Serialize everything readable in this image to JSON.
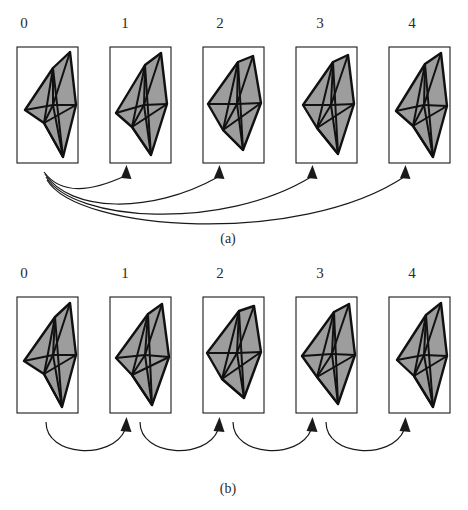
{
  "figure": {
    "width": 468,
    "height": 510,
    "background": "#ffffff",
    "ink_color": "#1a1a1a",
    "mesh_fill": "#9d9d9d",
    "mesh_edge": "#111111"
  },
  "panels": [
    {
      "id": "a",
      "caption": "(a)",
      "caption_x": 228,
      "caption_y": 243,
      "arrow_style": "fan-out-from-zero",
      "arrows": [
        {
          "from": "0",
          "to": "1"
        },
        {
          "from": "0",
          "to": "2"
        },
        {
          "from": "0",
          "to": "3"
        },
        {
          "from": "0",
          "to": "4"
        }
      ],
      "items": [
        {
          "label": "0",
          "label_x": 24,
          "label_y": 28,
          "box_x": 17,
          "box_y": 47,
          "box_w": 61,
          "box_h": 116
        },
        {
          "label": "1",
          "label_x": 125,
          "label_y": 28,
          "box_x": 110,
          "box_y": 47,
          "box_w": 61,
          "box_h": 116
        },
        {
          "label": "2",
          "label_x": 220,
          "label_y": 28,
          "box_x": 203,
          "box_y": 47,
          "box_w": 61,
          "box_h": 116
        },
        {
          "label": "3",
          "label_x": 320,
          "label_y": 28,
          "box_x": 296,
          "box_y": 47,
          "box_w": 61,
          "box_h": 116
        },
        {
          "label": "4",
          "label_x": 412,
          "label_y": 28,
          "box_x": 389,
          "box_y": 47,
          "box_w": 61,
          "box_h": 116
        }
      ]
    },
    {
      "id": "b",
      "caption": "(b)",
      "caption_x": 228,
      "caption_y": 493,
      "arrow_style": "sequential-chain",
      "arrows": [
        {
          "from": "0",
          "to": "1"
        },
        {
          "from": "1",
          "to": "2"
        },
        {
          "from": "2",
          "to": "3"
        },
        {
          "from": "3",
          "to": "4"
        }
      ],
      "items": [
        {
          "label": "0",
          "label_x": 24,
          "label_y": 278,
          "box_x": 17,
          "box_y": 297,
          "box_w": 61,
          "box_h": 116
        },
        {
          "label": "1",
          "label_x": 125,
          "label_y": 278,
          "box_x": 110,
          "box_y": 297,
          "box_w": 61,
          "box_h": 116
        },
        {
          "label": "2",
          "label_x": 220,
          "label_y": 278,
          "box_x": 203,
          "box_y": 297,
          "box_w": 61,
          "box_h": 116
        },
        {
          "label": "3",
          "label_x": 320,
          "label_y": 278,
          "box_x": 296,
          "box_y": 297,
          "box_w": 61,
          "box_h": 116
        },
        {
          "label": "4",
          "label_x": 412,
          "label_y": 278,
          "box_x": 389,
          "box_y": 297,
          "box_w": 61,
          "box_h": 116
        }
      ]
    }
  ],
  "meshes": {
    "a0": {
      "outline": "36,21 53,5 59,58 46,110 27,76 8,63",
      "edges": [
        "36,21 27,76",
        "36,21 46,110",
        "53,5 36,58",
        "36,58 8,63",
        "36,58 27,76",
        "36,58 46,110",
        "36,58 59,58",
        "27,76 59,58",
        "27,76 46,110",
        "8,63 27,76",
        "36,21 36,58"
      ]
    },
    "a1": {
      "outline": "35,18 51,6 57,57 41,108 22,80 6,66",
      "edges": [
        "35,18 22,80",
        "35,18 41,108",
        "51,6 34,58",
        "34,58 6,66",
        "34,58 22,80",
        "34,58 41,108",
        "34,58 57,57",
        "22,80 57,57",
        "22,80 41,108",
        "35,18 34,58"
      ]
    },
    "a2": {
      "outline": "35,15 50,9 58,56 40,103 20,83 5,57",
      "edges": [
        "35,15 20,83",
        "35,15 40,103",
        "50,9 34,57",
        "34,57 5,57",
        "34,57 20,83",
        "34,57 40,103",
        "34,57 58,56",
        "20,83 58,56",
        "20,83 40,103",
        "35,15 34,57"
      ]
    },
    "a3": {
      "outline": "37,15 52,8 58,57 42,107 21,81 7,58",
      "edges": [
        "37,15 21,81",
        "37,15 42,107",
        "52,8 35,58",
        "35,58 7,58",
        "35,58 21,81",
        "35,58 42,107",
        "35,58 58,57",
        "21,81 58,57",
        "21,81 42,107",
        "37,15 35,58"
      ]
    },
    "a4": {
      "outline": "36,17 52,6 58,59 44,110 24,79 7,64",
      "edges": [
        "36,17 24,79",
        "36,17 44,110",
        "52,6 35,58",
        "35,58 7,64",
        "35,58 24,79",
        "35,58 44,110",
        "35,58 58,59",
        "24,79 58,59",
        "24,79 44,110",
        "36,17 35,58"
      ]
    },
    "b0": {
      "outline": "38,20 53,6 59,58 45,110 27,77 7,64",
      "edges": [
        "38,20 27,77",
        "38,20 45,110",
        "53,6 36,58",
        "36,58 7,64",
        "36,58 27,77",
        "36,58 45,110",
        "36,58 59,58",
        "27,77 59,58",
        "27,77 45,110",
        "38,20 36,58"
      ]
    },
    "b1": {
      "outline": "38,17 52,7 59,60 42,108 22,78 6,61",
      "edges": [
        "38,17 22,78",
        "38,17 42,108",
        "52,7 35,58",
        "35,58 6,61",
        "35,58 22,78",
        "35,58 42,108",
        "35,58 59,60",
        "22,78 59,60",
        "22,78 42,108",
        "38,17 35,58"
      ]
    },
    "b2": {
      "outline": "36,14 51,9 58,55 41,101 19,82 4,56",
      "edges": [
        "36,14 19,82",
        "36,14 41,101",
        "51,9 34,56",
        "34,56 4,56",
        "34,56 19,82",
        "34,56 41,101",
        "34,56 58,55",
        "19,82 58,55",
        "19,82 41,101",
        "36,14 34,56"
      ]
    },
    "b3": {
      "outline": "38,15 53,7 59,58 42,107 21,80 6,59",
      "edges": [
        "38,15 21,80",
        "38,15 42,107",
        "53,7 36,57",
        "36,57 6,59",
        "36,57 21,80",
        "36,57 42,107",
        "36,57 59,58",
        "21,80 59,58",
        "21,80 42,107",
        "38,15 36,57"
      ]
    },
    "b4": {
      "outline": "37,18 52,6 58,59 44,110 25,79 8,63",
      "edges": [
        "37,18 25,79",
        "37,18 44,110",
        "52,6 35,58",
        "35,58 8,63",
        "35,58 25,79",
        "35,58 44,110",
        "35,58 58,59",
        "25,79 58,59",
        "25,79 44,110",
        "37,18 35,58"
      ]
    }
  }
}
